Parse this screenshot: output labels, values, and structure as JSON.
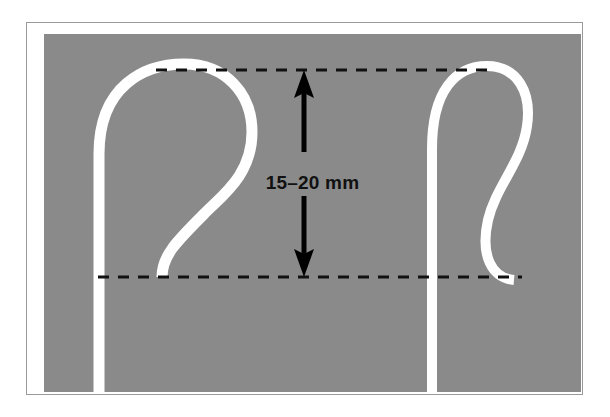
{
  "figure": {
    "frame": {
      "border_color": "#9a9a9a",
      "background_color": "#ffffff"
    },
    "panel": {
      "background_color": "#8a8a8a",
      "width": 537,
      "height": 358
    }
  },
  "annotation": {
    "dimension_label": "15–20 mm",
    "value_min": 15,
    "value_max": 20,
    "unit": "mm",
    "text_color": "#111111"
  },
  "guides": {
    "top_line": {
      "name": "upper-reference-line",
      "style": "dashed",
      "color": "#111111",
      "y": 36
    },
    "bottom_line": {
      "name": "lower-reference-line",
      "style": "dashed",
      "color": "#111111",
      "y": 243
    }
  },
  "arrow": {
    "name": "double-headed-measure-arrow",
    "color": "#000000",
    "direction": "vertical-both",
    "x": 260,
    "y_top": 36,
    "y_bottom": 243
  },
  "shapes": [
    {
      "name": "catheter-loop-left",
      "color": "#ffffff",
      "description": "wide pigtail loop with S-curve tail, shaft exits bottom"
    },
    {
      "name": "catheter-loop-right",
      "color": "#ffffff",
      "description": "narrow pigtail loop with S-curve tail, shaft exits bottom"
    }
  ]
}
